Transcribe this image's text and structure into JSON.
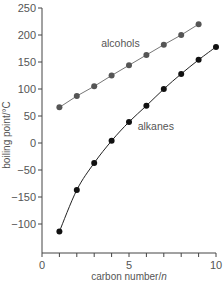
{
  "chart_data": {
    "type": "line",
    "title": "",
    "xlabel": "carbon number/n",
    "xlabel_prefix": "carbon number/",
    "xlabel_italic": "n",
    "ylabel": "boiling point/°C",
    "xlim": [
      0,
      10
    ],
    "ylim": [
      -175,
      250
    ],
    "grid": false,
    "legend_position": "inline labels",
    "x_ticks": [
      0,
      1,
      2,
      3,
      4,
      5,
      6,
      7,
      8,
      9,
      10
    ],
    "x_tick_labels": [
      {
        "value": 0,
        "label": "0"
      },
      {
        "value": 5,
        "label": "5"
      },
      {
        "value": 10,
        "label": "10"
      }
    ],
    "y_tick_labels": [
      {
        "value": 250,
        "label": "250"
      },
      {
        "value": 200,
        "label": "200"
      },
      {
        "value": 150,
        "label": "150"
      },
      {
        "value": 100,
        "label": "100"
      },
      {
        "value": 50,
        "label": "50"
      },
      {
        "value": 0,
        "label": "0"
      },
      {
        "value": -50,
        "label": "−50"
      },
      {
        "value": -100,
        "label": "−150"
      },
      {
        "value": -150,
        "label": "−100"
      }
    ],
    "series": [
      {
        "name": "alcohols",
        "color": "#555555",
        "line_color": "#777777",
        "x": [
          1,
          2,
          3,
          4,
          5,
          6,
          7,
          8,
          9
        ],
        "values": [
          66,
          87,
          105,
          125,
          144,
          163,
          182,
          200,
          220
        ],
        "label_pos": {
          "x": 3.4,
          "y": 178
        }
      },
      {
        "name": "alkanes",
        "color": "#111111",
        "line_color": "#222222",
        "x": [
          1,
          2,
          3,
          4,
          5,
          6,
          7,
          8,
          9,
          10
        ],
        "values": [
          -164,
          -87,
          -37,
          4,
          39,
          69,
          100,
          128,
          154,
          178
        ],
        "label_pos": {
          "x": 5.5,
          "y": 25
        },
        "curve": "smooth"
      }
    ]
  }
}
